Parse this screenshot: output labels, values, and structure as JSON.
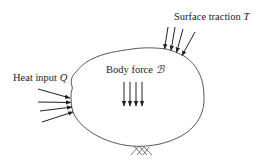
{
  "diagram": {
    "labels": {
      "surface_traction": {
        "text": "Surface traction ",
        "symbol": "T"
      },
      "heat_input": {
        "text": "Heat input ",
        "symbol": "Q"
      },
      "body_force": {
        "text": "Body force ",
        "symbol": "ℬ"
      }
    },
    "elements": {
      "body_outline": "body-boundary",
      "traction_arrows_count": 4,
      "heat_arrows_count": 4,
      "body_force_arrows_count": 4,
      "support": "fixed-support-hatch"
    },
    "colors": {
      "stroke": "#222222",
      "background": "#ffffff"
    }
  }
}
